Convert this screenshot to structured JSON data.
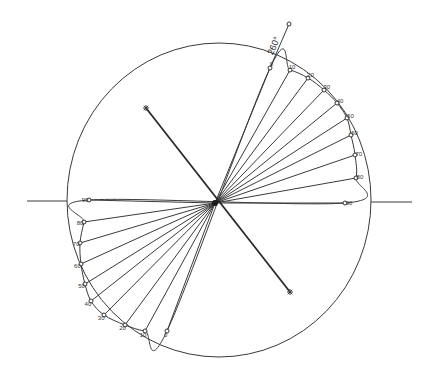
{
  "diagram": {
    "title_label": "260°",
    "center": [
      215,
      203
    ],
    "outer_circle": {
      "cx": 219,
      "cy": 200,
      "rx": 152,
      "ry": 157
    },
    "horizontal_axis": {
      "x1": 27,
      "x2": 412,
      "y": 201
    },
    "main_line": {
      "from": [
        146,
        108
      ],
      "to": [
        290,
        292
      ]
    },
    "direction_line": {
      "from": [
        270,
        68
      ],
      "to": [
        289,
        24
      ]
    },
    "right_fan": [
      {
        "label": "0",
        "x": 270,
        "y": 68
      },
      {
        "label": "10",
        "x": 290,
        "y": 70
      },
      {
        "label": "20",
        "x": 308,
        "y": 78
      },
      {
        "label": "30",
        "x": 324,
        "y": 90
      },
      {
        "label": "40",
        "x": 337,
        "y": 103
      },
      {
        "label": "50",
        "x": 347,
        "y": 118
      },
      {
        "label": "60",
        "x": 351,
        "y": 135
      },
      {
        "label": "70",
        "x": 355,
        "y": 155
      },
      {
        "label": "80",
        "x": 356,
        "y": 178
      },
      {
        "label": "90",
        "x": 345,
        "y": 203
      }
    ],
    "left_fan": [
      {
        "label": "90",
        "x": 89,
        "y": 200
      },
      {
        "label": "80",
        "x": 84,
        "y": 222
      },
      {
        "label": "70",
        "x": 80,
        "y": 243
      },
      {
        "label": "60",
        "x": 81,
        "y": 264
      },
      {
        "label": "50",
        "x": 85,
        "y": 284
      },
      {
        "label": "40",
        "x": 91,
        "y": 301
      },
      {
        "label": "30",
        "x": 104,
        "y": 315
      },
      {
        "label": "20",
        "x": 125,
        "y": 325
      },
      {
        "label": "10",
        "x": 145,
        "y": 331
      },
      {
        "label": "0",
        "x": 167,
        "y": 331
      }
    ]
  }
}
